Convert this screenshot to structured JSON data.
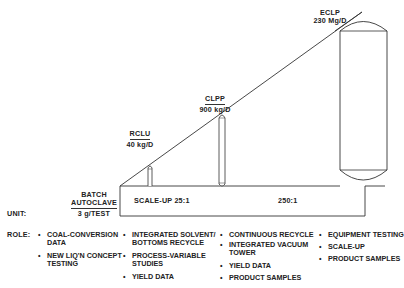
{
  "diagram": {
    "type": "scale-up progression",
    "units": [
      {
        "id": "batch",
        "name_lines": [
          "BATCH",
          "AUTOCLAVE"
        ],
        "capacity": "3 g/TEST"
      },
      {
        "id": "rclu",
        "name": "RCLU",
        "capacity": "40 kg/D"
      },
      {
        "id": "clpp",
        "name": "CLPP",
        "capacity": "900 kg/D"
      },
      {
        "id": "eclp",
        "name": "ECLP",
        "capacity": "230 Mg/D"
      }
    ],
    "scale_labels": {
      "first": "SCALE-UP  25:1",
      "second": "250:1"
    },
    "row_labels": {
      "unit": "UNIT:",
      "role": "ROLE:"
    },
    "roles": [
      {
        "column": "batch",
        "items": [
          [
            "COAL-CONVERSION",
            "DATA"
          ],
          [
            "NEW LIQ'N CONCEPT",
            "TESTING"
          ]
        ]
      },
      {
        "column": "rclu",
        "items": [
          [
            "INTEGRATED SOLVENT/",
            "BOTTOMS RECYCLE"
          ],
          [
            "PROCESS-VARIABLE",
            "STUDIES"
          ],
          [
            "YIELD DATA"
          ]
        ]
      },
      {
        "column": "clpp",
        "items": [
          [
            "CONTINUOUS RECYCLE"
          ],
          [
            "INTEGRATED VACUUM",
            "TOWER"
          ],
          [
            "YIELD DATA"
          ],
          [
            "PRODUCT SAMPLES"
          ]
        ]
      },
      {
        "column": "eclp",
        "items": [
          [
            "EQUIPMENT TESTING"
          ],
          [
            "SCALE-UP"
          ],
          [
            "PRODUCT SAMPLES"
          ]
        ]
      }
    ],
    "bullet": "•"
  }
}
